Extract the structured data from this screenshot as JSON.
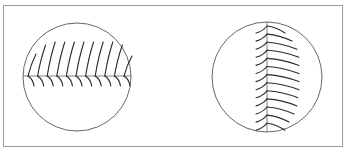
{
  "figure": {
    "width": 347,
    "height": 153,
    "frame": {
      "x": 3.5,
      "y": 5.5,
      "w": 339,
      "h": 141,
      "color": "#9a9a9a"
    },
    "panels": [
      {
        "id": "left",
        "orientation": "horizontal",
        "circle": {
          "cx": 77,
          "cy": 77,
          "r": 54
        },
        "axis": {
          "x1": 23,
          "y1": 76,
          "x2": 131,
          "y2": 76
        },
        "barb_count": 11,
        "barb_start": 28,
        "barb_step": 9.6,
        "barb_upper_heights": [
          22,
          31,
          34,
          34,
          34,
          34,
          34,
          34,
          34,
          31,
          20
        ],
        "barb_lower_length": 10
      },
      {
        "id": "right",
        "orientation": "vertical",
        "circle": {
          "cx": 267,
          "cy": 77,
          "r": 55
        },
        "axis": {
          "x1": 267,
          "y1": 22,
          "x2": 267,
          "y2": 132
        },
        "barb_count": 13,
        "barb_start": 26,
        "barb_step": 8.1,
        "barb_right_lengths": [
          18,
          25,
          30,
          32,
          32,
          32,
          32,
          32,
          31,
          30,
          27,
          22,
          18
        ],
        "barb_left_length": 11
      }
    ],
    "colors": {
      "barb": "#2a2a2a",
      "circle": "#555555",
      "axis": "#666666"
    }
  }
}
